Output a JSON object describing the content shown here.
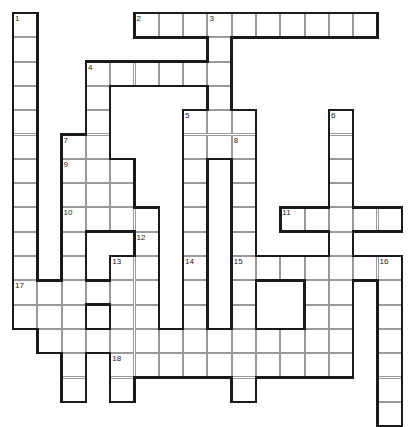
{
  "puzzle": {
    "title": "Crossword Grid",
    "cell_size": 24.3,
    "origin_x": 13,
    "origin_y": 13,
    "cols": 16,
    "rows": 16,
    "background_color": "#ffffff",
    "cell_border_color": "#9a9a9a",
    "outline_color": "#1a1a1a",
    "number_color": "#1a1a1a",
    "cells": [
      [
        0,
        0
      ],
      [
        0,
        1
      ],
      [
        0,
        2
      ],
      [
        0,
        3
      ],
      [
        0,
        4
      ],
      [
        0,
        5
      ],
      [
        0,
        6
      ],
      [
        0,
        7
      ],
      [
        0,
        8
      ],
      [
        0,
        9
      ],
      [
        0,
        10
      ],
      [
        0,
        11
      ],
      [
        0,
        12
      ],
      [
        1,
        11
      ],
      [
        1,
        12
      ],
      [
        2,
        11
      ],
      [
        2,
        12
      ],
      [
        3,
        11
      ],
      [
        3,
        12
      ],
      [
        4,
        11
      ],
      [
        4,
        12
      ],
      [
        5,
        0
      ],
      [
        6,
        0
      ],
      [
        7,
        0
      ],
      [
        8,
        0
      ],
      [
        9,
        0
      ],
      [
        10,
        0
      ],
      [
        11,
        0
      ],
      [
        12,
        0
      ],
      [
        13,
        0
      ],
      [
        14,
        0
      ],
      [
        15,
        0
      ],
      [
        4,
        2
      ],
      [
        5,
        2
      ],
      [
        6,
        2
      ],
      [
        7,
        2
      ],
      [
        8,
        2
      ],
      [
        9,
        2
      ],
      [
        10,
        2
      ],
      [
        11,
        2
      ],
      [
        5,
        3
      ],
      [
        6,
        3
      ],
      [
        7,
        3
      ],
      [
        4,
        4
      ],
      [
        5,
        4
      ],
      [
        6,
        4
      ],
      [
        7,
        4
      ],
      [
        4,
        5
      ],
      [
        5,
        5
      ],
      [
        6,
        5
      ],
      [
        7,
        5
      ],
      [
        8,
        1
      ],
      [
        8,
        2
      ],
      [
        8,
        3
      ],
      [
        8,
        4
      ],
      [
        2,
        6
      ],
      [
        3,
        6
      ],
      [
        4,
        6
      ],
      [
        5,
        6
      ],
      [
        6,
        6
      ],
      [
        7,
        6
      ],
      [
        8,
        6
      ],
      [
        9,
        6
      ],
      [
        10,
        6
      ],
      [
        11,
        6
      ],
      [
        12,
        6
      ],
      [
        13,
        6
      ],
      [
        3,
        7
      ],
      [
        4,
        7
      ],
      [
        5,
        7
      ],
      [
        6,
        7
      ],
      [
        7,
        7
      ],
      [
        8,
        7
      ],
      [
        9,
        7
      ],
      [
        10,
        7
      ],
      [
        11,
        7
      ],
      [
        6,
        8
      ],
      [
        7,
        8
      ],
      [
        8,
        8
      ],
      [
        9,
        8
      ],
      [
        10,
        8
      ],
      [
        11,
        8
      ],
      [
        12,
        8
      ],
      [
        13,
        8
      ],
      [
        14,
        8
      ],
      [
        15,
        8
      ],
      [
        11,
        9
      ],
      [
        12,
        9
      ],
      [
        13,
        9
      ],
      [
        14,
        9
      ],
      [
        15,
        9
      ],
      [
        9,
        10
      ],
      [
        10,
        10
      ],
      [
        11,
        10
      ],
      [
        12,
        10
      ],
      [
        13,
        10
      ],
      [
        14,
        10
      ],
      [
        1,
        13
      ],
      [
        2,
        13
      ],
      [
        3,
        13
      ],
      [
        4,
        13
      ],
      [
        5,
        13
      ],
      [
        6,
        13
      ],
      [
        7,
        13
      ],
      [
        8,
        13
      ],
      [
        9,
        13
      ],
      [
        10,
        13
      ],
      [
        11,
        13
      ],
      [
        12,
        13
      ],
      [
        13,
        13
      ],
      [
        1,
        14
      ],
      [
        12,
        14
      ],
      [
        4,
        14
      ],
      [
        4,
        15
      ]
    ],
    "numbers": [
      {
        "n": "1",
        "col": 0,
        "row": 0
      },
      {
        "n": "2",
        "col": 5,
        "row": 0
      },
      {
        "n": "3",
        "col": 8,
        "row": 0
      },
      {
        "n": "4",
        "col": 3,
        "row": 2
      },
      {
        "n": "5",
        "col": 7,
        "row": 4
      },
      {
        "n": "6",
        "col": 13,
        "row": 4
      },
      {
        "n": "7",
        "col": 2,
        "row": 5
      },
      {
        "n": "8",
        "col": 9,
        "row": 5
      },
      {
        "n": "9",
        "col": 2,
        "row": 6
      },
      {
        "n": "10",
        "col": 2,
        "row": 8
      },
      {
        "n": "11",
        "col": 11,
        "row": 8
      },
      {
        "n": "12",
        "col": 5,
        "row": 9
      },
      {
        "n": "13",
        "col": 4,
        "row": 10
      },
      {
        "n": "14",
        "col": 7,
        "row": 10
      },
      {
        "n": "15",
        "col": 9,
        "row": 10
      },
      {
        "n": "16",
        "col": 15,
        "row": 10
      },
      {
        "n": "17",
        "col": 0,
        "row": 11
      },
      {
        "n": "18",
        "col": 4,
        "row": 14
      }
    ],
    "entries": {
      "across": [
        {
          "n": "2",
          "col": 5,
          "row": 0,
          "len": 10
        },
        {
          "n": "4",
          "col": 3,
          "row": 2,
          "len": 6
        },
        {
          "n": "9",
          "col": 2,
          "row": 6,
          "len": 3
        },
        {
          "n": "10",
          "col": 2,
          "row": 8,
          "len": 4
        },
        {
          "n": "11",
          "col": 11,
          "row": 8,
          "len": 5
        },
        {
          "n": "15",
          "col": 9,
          "row": 10,
          "len": 7
        },
        {
          "n": "17",
          "col": 0,
          "row": 11,
          "len": 6
        },
        {
          "n": "18",
          "col": 4,
          "row": 14,
          "len": 10
        }
      ],
      "down": [
        {
          "n": "1",
          "col": 0,
          "row": 0,
          "len": 13
        },
        {
          "n": "3",
          "col": 8,
          "row": 0,
          "len": 6
        },
        {
          "n": "4",
          "col": 3,
          "row": 2,
          "len": 5
        },
        {
          "n": "5",
          "col": 7,
          "row": 4,
          "len": 11
        },
        {
          "n": "6",
          "col": 13,
          "row": 4,
          "len": 11
        },
        {
          "n": "7",
          "col": 2,
          "row": 5,
          "len": 11
        },
        {
          "n": "8",
          "col": 9,
          "row": 5,
          "len": 11
        },
        {
          "n": "12",
          "col": 5,
          "row": 9,
          "len": 6
        },
        {
          "n": "13",
          "col": 4,
          "row": 10,
          "len": 6
        },
        {
          "n": "14",
          "col": 7,
          "row": 10,
          "len": 5
        },
        {
          "n": "16",
          "col": 15,
          "row": 10,
          "len": 7
        }
      ]
    }
  }
}
